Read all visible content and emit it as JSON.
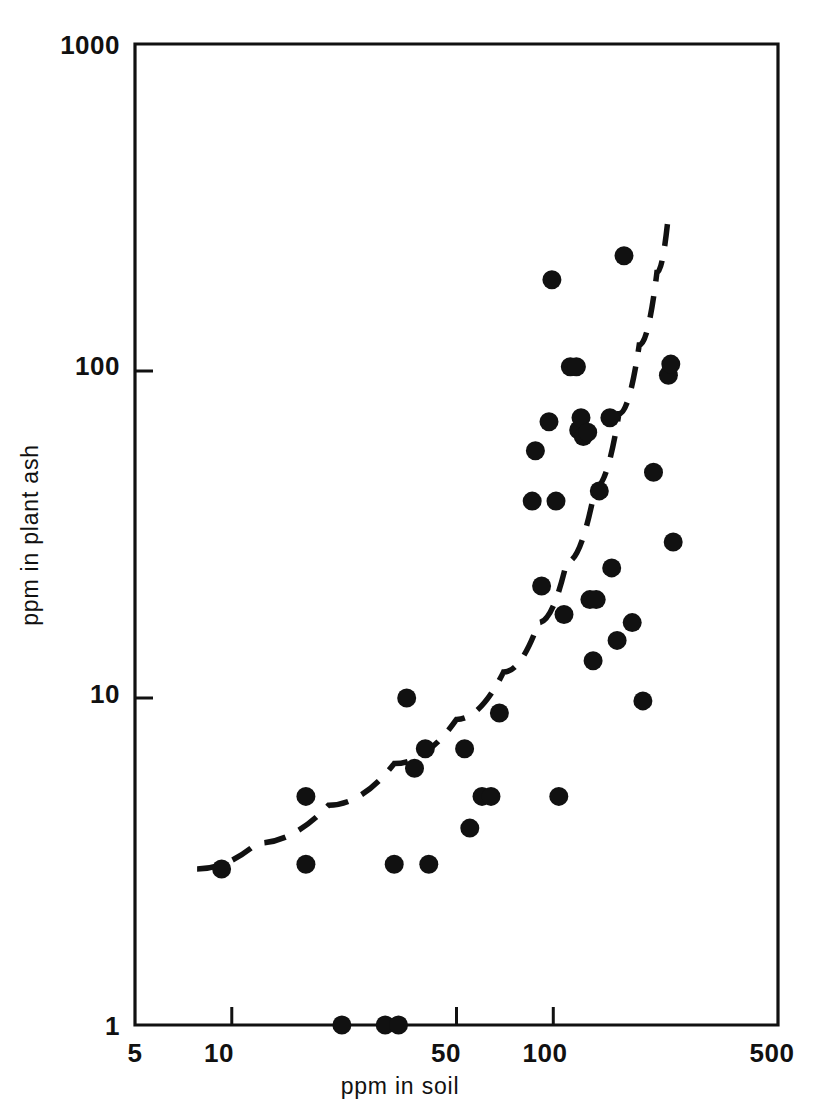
{
  "figure": {
    "background_color": "#ffffff",
    "ink_color": "#111111"
  },
  "axes": {
    "x": {
      "label": "ppm in soil",
      "scale": "log",
      "range": [
        5,
        500
      ],
      "tick_labels": [
        "5",
        "10",
        "50",
        "100",
        "500"
      ],
      "tick_values": [
        5,
        10,
        50,
        100,
        500
      ]
    },
    "y": {
      "label": "ppm in plant ash",
      "scale": "log",
      "range": [
        1,
        1000
      ],
      "tick_labels": [
        "1",
        "10",
        "100",
        "1000"
      ],
      "tick_values": [
        1,
        10,
        100,
        1000
      ]
    }
  },
  "chart_data": {
    "type": "scatter",
    "title": "",
    "xlabel": "ppm in soil",
    "ylabel": "ppm in plant ash",
    "xscale": "log",
    "yscale": "log",
    "xlim": [
      5,
      500
    ],
    "ylim": [
      1,
      1000
    ],
    "grid": false,
    "legend": "none",
    "marker": "filled-circle",
    "marker_color": "#111111",
    "series": [
      {
        "name": "samples",
        "points": [
          [
            9.3,
            3.0
          ],
          [
            17,
            5.0
          ],
          [
            17,
            3.1
          ],
          [
            22,
            1.0
          ],
          [
            30,
            1.0
          ],
          [
            32,
            3.1
          ],
          [
            33,
            1.0
          ],
          [
            35,
            10.0
          ],
          [
            37,
            6.1
          ],
          [
            40,
            7.0
          ],
          [
            41,
            3.1
          ],
          [
            53,
            7.0
          ],
          [
            55,
            4.0
          ],
          [
            60,
            5.0
          ],
          [
            64,
            5.0
          ],
          [
            68,
            9.0
          ],
          [
            86,
            40
          ],
          [
            88,
            57
          ],
          [
            92,
            22
          ],
          [
            97,
            70
          ],
          [
            99,
            190
          ],
          [
            102,
            40
          ],
          [
            104,
            5.0
          ],
          [
            108,
            18
          ],
          [
            113,
            103
          ],
          [
            118,
            103
          ],
          [
            120,
            66
          ],
          [
            122,
            72
          ],
          [
            124,
            63
          ],
          [
            128,
            65
          ],
          [
            130,
            20
          ],
          [
            133,
            13
          ],
          [
            136,
            20
          ],
          [
            139,
            43
          ],
          [
            150,
            72
          ],
          [
            152,
            25
          ],
          [
            158,
            15
          ],
          [
            166,
            225
          ],
          [
            176,
            17
          ],
          [
            190,
            9.8
          ],
          [
            205,
            49
          ],
          [
            228,
            97
          ],
          [
            232,
            105
          ],
          [
            236,
            30
          ]
        ]
      }
    ],
    "annotations": [
      {
        "type": "trend-curve",
        "style": "dashed",
        "description": "upward-curving dashed reference line from lower-left to upper-right",
        "points": [
          [
            7.8,
            3.0
          ],
          [
            12,
            3.6
          ],
          [
            20,
            4.7
          ],
          [
            32,
            6.3
          ],
          [
            50,
            8.6
          ],
          [
            70,
            12
          ],
          [
            90,
            17
          ],
          [
            110,
            26
          ],
          [
            135,
            44
          ],
          [
            160,
            74
          ],
          [
            185,
            120
          ],
          [
            210,
            200
          ],
          [
            228,
            300
          ]
        ]
      }
    ]
  }
}
